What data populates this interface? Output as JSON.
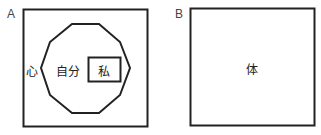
{
  "panels": {
    "a": {
      "label": "A",
      "outer_text": "心",
      "middle_text": "自分",
      "inner_text": "私"
    },
    "b": {
      "label": "B",
      "center_text": "体"
    }
  }
}
